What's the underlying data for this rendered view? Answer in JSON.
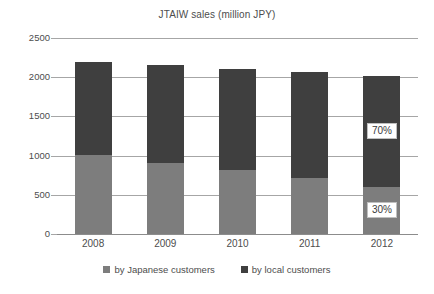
{
  "chart_data": {
    "type": "bar",
    "subtype": "stacked-bar",
    "title": "JTAIW sales (million JPY)",
    "xlabel": "",
    "ylabel": "",
    "categories": [
      "2008",
      "2009",
      "2010",
      "2011",
      "2012"
    ],
    "series": [
      {
        "name": "by Japanese customers",
        "color": "#7d7d7d",
        "values": [
          1010,
          910,
          810,
          720,
          600
        ]
      },
      {
        "name": "by local customers",
        "color": "#3f3f3f",
        "values": [
          1190,
          1240,
          1300,
          1340,
          1420
        ]
      }
    ],
    "totals": [
      2200,
      2150,
      2110,
      2060,
      2020
    ],
    "ylim": [
      0,
      2500
    ],
    "yticks": [
      0,
      500,
      1000,
      1500,
      2000,
      2500
    ],
    "ytick_labels": [
      "0",
      "500",
      "1000",
      "1500",
      "2000",
      "2500"
    ],
    "grid": true,
    "legend_position": "bottom",
    "annotations": [
      {
        "text": "70%",
        "category": "2012",
        "series": "by local customers",
        "value": 1310
      },
      {
        "text": "30%",
        "category": "2012",
        "series": "by Japanese customers",
        "value": 300
      }
    ]
  },
  "legend": {
    "entries": [
      {
        "label": "by Japanese customers",
        "color": "#7d7d7d"
      },
      {
        "label": "by local customers",
        "color": "#3f3f3f"
      }
    ]
  },
  "colors": {
    "japanese_customers": "#7d7d7d",
    "local_customers": "#3f3f3f",
    "gridline": "#a6a6a6",
    "text": "#4d4d4d",
    "background": "#ffffff"
  }
}
